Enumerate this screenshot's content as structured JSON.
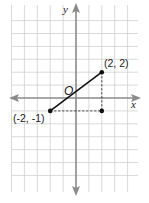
{
  "diagram": {
    "type": "coordinate-plane",
    "axes": {
      "x_label": "x",
      "y_label": "y",
      "origin_label": "O"
    },
    "grid": {
      "x_min": -5,
      "x_max": 4,
      "y_min": -6,
      "y_max": 6
    },
    "points": [
      {
        "x": -2,
        "y": -1,
        "label": "(-2, -1)"
      },
      {
        "x": 2,
        "y": 2,
        "label": "(2, 2)"
      },
      {
        "x": 2,
        "y": -1,
        "label": ""
      }
    ],
    "segment": {
      "from": [
        -2,
        -1
      ],
      "to": [
        2,
        2
      ],
      "style": "solid"
    },
    "dashed_lines": [
      {
        "from": [
          -2,
          -1
        ],
        "to": [
          2,
          -1
        ]
      },
      {
        "from": [
          2,
          2
        ],
        "to": [
          2,
          -1
        ]
      }
    ],
    "colors": {
      "grid": "#cfcfcf",
      "axis": "#8a8a8a",
      "segment": "#111111",
      "point": "#111111"
    }
  }
}
